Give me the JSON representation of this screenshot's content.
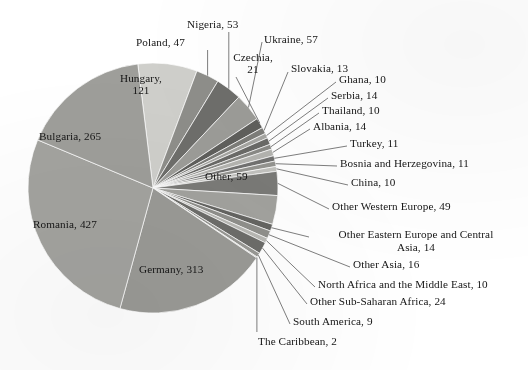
{
  "chart_data": {
    "type": "pie",
    "title": "",
    "xlabel": "",
    "ylabel": "",
    "legend_position": "none",
    "grid": false,
    "total": 1585,
    "start_angle_deg": -97,
    "direction": "clockwise",
    "center": {
      "x": 153,
      "y": 188
    },
    "radius": 125,
    "categories": [
      "Hungary",
      "Poland",
      "Nigeria",
      "Ukraine",
      "Czechia",
      "Slovakia",
      "Ghana",
      "Serbia",
      "Thailand",
      "Albania",
      "Turkey",
      "Bosnia and Herzegovina",
      "China",
      "Other Western Europe",
      "Other",
      "Other Eastern Europe and Central Asia",
      "Other Asia",
      "North Africa and the Middle East",
      "Other Sub-Saharan Africa",
      "South America",
      "The Caribbean",
      "Germany",
      "Romania",
      "Bulgaria"
    ],
    "values": [
      121,
      47,
      53,
      57,
      21,
      13,
      10,
      14,
      10,
      14,
      11,
      11,
      10,
      49,
      59,
      14,
      16,
      10,
      24,
      9,
      2,
      313,
      427,
      265
    ],
    "slices": [
      {
        "name": "Hungary",
        "value": 121,
        "color": "#cfcfcb",
        "label": "Hungary,\n121",
        "label_lines": [
          "Hungary,",
          "121"
        ]
      },
      {
        "name": "Poland",
        "value": 47,
        "color": "#8e8e8a",
        "label": "Poland, 47",
        "label_lines": [
          "Poland, 47"
        ]
      },
      {
        "name": "Nigeria",
        "value": 53,
        "color": "#6e6e6b",
        "label": "Nigeria, 53",
        "label_lines": [
          "Nigeria, 53"
        ]
      },
      {
        "name": "Ukraine",
        "value": 57,
        "color": "#9c9c98",
        "label": "Ukraine, 57",
        "label_lines": [
          "Ukraine, 57"
        ]
      },
      {
        "name": "Czechia",
        "value": 21,
        "color": "#5f5f5c",
        "label": "Czechia,\n21",
        "label_lines": [
          "Czechia,",
          "21"
        ]
      },
      {
        "name": "Slovakia",
        "value": 13,
        "color": "#7d7d79",
        "label": "Slovakia, 13",
        "label_lines": [
          "Slovakia, 13"
        ]
      },
      {
        "name": "Ghana",
        "value": 10,
        "color": "#a6a6a2",
        "label": "Ghana, 10",
        "label_lines": [
          "Ghana, 10"
        ]
      },
      {
        "name": "Serbia",
        "value": 14,
        "color": "#6a6a67",
        "label": "Serbia, 14",
        "label_lines": [
          "Serbia, 14"
        ]
      },
      {
        "name": "Thailand",
        "value": 10,
        "color": "#8a8a86",
        "label": "Thailand, 10",
        "label_lines": [
          "Thailand, 10"
        ]
      },
      {
        "name": "Albania",
        "value": 14,
        "color": "#b4b4b0",
        "label": "Albania, 14",
        "label_lines": [
          "Albania, 14"
        ]
      },
      {
        "name": "Turkey",
        "value": 11,
        "color": "#717170",
        "label": "Turkey, 11",
        "label_lines": [
          "Turkey, 11"
        ]
      },
      {
        "name": "Bosnia and Herzegovina",
        "value": 11,
        "color": "#949490",
        "label": "Bosnia and Herzegovina, 11",
        "label_lines": [
          "Bosnia and Herzegovina, 11"
        ]
      },
      {
        "name": "China",
        "value": 10,
        "color": "#c2c2be",
        "label": "China, 10",
        "label_lines": [
          "China, 10"
        ]
      },
      {
        "name": "Other Western Europe",
        "value": 49,
        "color": "#7a7a77",
        "label": "Other Western Europe, 49",
        "label_lines": [
          "Other Western Europe, 49"
        ]
      },
      {
        "name": "Other",
        "value": 59,
        "color": "#a2a29e",
        "label": "Other, 59",
        "label_lines": [
          "Other, 59"
        ]
      },
      {
        "name": "Other Eastern Europe and Central Asia",
        "value": 14,
        "color": "#646461",
        "label": "Other Eastern Europe and Central Asia, 14",
        "label_lines": [
          "Other Eastern Europe and Central",
          "Asia, 14"
        ]
      },
      {
        "name": "Other Asia",
        "value": 16,
        "color": "#8f8f8b",
        "label": "Other Asia, 16",
        "label_lines": [
          "Other Asia, 16"
        ]
      },
      {
        "name": "North Africa and the Middle East",
        "value": 10,
        "color": "#b8b8b4",
        "label": "North Africa and the Middle East, 10",
        "label_lines": [
          "North Africa and the Middle East, 10"
        ]
      },
      {
        "name": "Other Sub-Saharan Africa",
        "value": 24,
        "color": "#6d6d6a",
        "label": "Other Sub-Saharan Africa, 24",
        "label_lines": [
          "Other Sub-Saharan Africa, 24"
        ]
      },
      {
        "name": "South America",
        "value": 9,
        "color": "#989894",
        "label": "South America, 9",
        "label_lines": [
          "South America, 9"
        ]
      },
      {
        "name": "The Caribbean",
        "value": 2,
        "color": "#c8c8c4",
        "label": "The Caribbean, 2",
        "label_lines": [
          "The Caribbean, 2"
        ]
      },
      {
        "name": "Germany",
        "value": 313,
        "color": "#9a9a96",
        "label": "Germany, 313",
        "label_lines": [
          "Germany, 313"
        ]
      },
      {
        "name": "Romania",
        "value": 427,
        "color": "#a3a39f",
        "label": "Romania, 427",
        "label_lines": [
          "Romania, 427"
        ]
      },
      {
        "name": "Bulgaria",
        "value": 265,
        "color": "#9e9e9a",
        "label": "Bulgaria, 265",
        "label_lines": [
          "Bulgaria, 265"
        ]
      }
    ]
  },
  "labels": {
    "hungary": "Hungary,",
    "hungary_2": "121",
    "poland": "Poland, 47",
    "nigeria": "Nigeria, 53",
    "ukraine": "Ukraine, 57",
    "czechia": "Czechia,",
    "czechia_2": "21",
    "slovakia": "Slovakia, 13",
    "ghana": "Ghana, 10",
    "serbia": "Serbia, 14",
    "thailand": "Thailand, 10",
    "albania": "Albania, 14",
    "turkey": "Turkey, 11",
    "bosnia": "Bosnia and Herzegovina, 11",
    "china": "China, 10",
    "other_west_eu": "Other Western Europe, 49",
    "other": "Other, 59",
    "other_east_eu": "Other Eastern Europe and Central",
    "other_east_eu_2": "Asia, 14",
    "other_asia": "Other Asia, 16",
    "north_africa": "North Africa and the Middle East, 10",
    "other_ssa": "Other Sub-Saharan Africa, 24",
    "south_america": "South America, 9",
    "caribbean": "The Caribbean, 2",
    "germany": "Germany, 313",
    "romania": "Romania, 427",
    "bulgaria": "Bulgaria, 265"
  },
  "colors": {
    "background": "#ffffff",
    "text": "#151515",
    "leader_line": "#6f6f6f",
    "slice_edge": "#ffffff"
  }
}
